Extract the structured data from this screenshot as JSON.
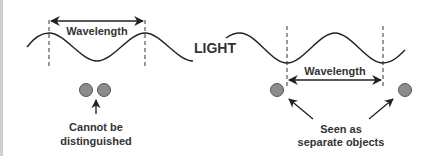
{
  "diagram": {
    "center_label": "LIGHT",
    "wavelength_label_left": "Wavelength",
    "wavelength_label_right": "Wavelength",
    "caption_left": [
      "Cannot be",
      "distinguished"
    ],
    "caption_right": [
      "Seen as",
      "separate objects"
    ],
    "colors": {
      "line": "#222222",
      "text": "#333333",
      "circle_fill": "#8c8c8c",
      "circle_stroke": "#555555",
      "left_bar": "#cfcfcf"
    }
  }
}
